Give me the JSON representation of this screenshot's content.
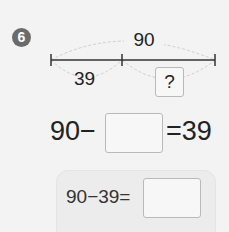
{
  "problem": {
    "number": "6",
    "diagram": {
      "total_label": "90",
      "part_label": "39",
      "unknown_label": "?"
    },
    "equation": {
      "left": "90−",
      "right": "=39"
    },
    "answer_row": {
      "expression": "90−39="
    }
  }
}
